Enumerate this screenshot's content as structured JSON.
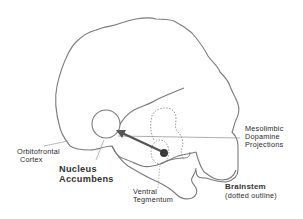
{
  "diagram": {
    "colors": {
      "outline": "#7a7a7a",
      "arrow": "#555555",
      "dot": "#3a3a3a",
      "text": "#2a2a2a",
      "background": "#ffffff"
    },
    "labels": {
      "orbitofrontal": {
        "line1": "Orbitofrontal",
        "line2": "Cortex"
      },
      "nucleus_accumbens": {
        "line1": "Nucleus",
        "line2": "Accumbens"
      },
      "ventral_tegmentum": {
        "line1": "Ventral",
        "line2": "Tegmentum"
      },
      "mesolimbic": {
        "line1": "Mesolimbic",
        "line2": "Dopamine",
        "line3": "Projections"
      },
      "brainstem": {
        "line1": "Brainstem",
        "line2": "(dotted outline)"
      }
    },
    "nodes": [
      {
        "id": "nucleus-accumbens",
        "shape": "circle",
        "cx": 106,
        "cy": 124,
        "r": 14
      },
      {
        "id": "ventral-tegmentum",
        "shape": "dot",
        "cx": 164,
        "cy": 153,
        "r": 4
      }
    ],
    "edges": [
      {
        "from": "ventral-tegmentum",
        "to": "nucleus-accumbens",
        "style": "thick-arrow"
      }
    ]
  }
}
